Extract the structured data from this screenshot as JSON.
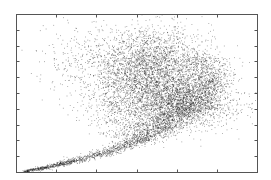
{
  "chart_data": {
    "type": "scatter",
    "title": "",
    "xlabel": "",
    "ylabel": "",
    "xlim": [
      0,
      6
    ],
    "ylim": [
      0,
      10
    ],
    "x_ticks": [
      1,
      2,
      3,
      4,
      5
    ],
    "y_ticks": [
      1,
      2,
      3,
      4,
      5,
      6,
      7,
      8,
      9
    ],
    "x_tick_labels": [],
    "y_tick_labels": [],
    "grid": false,
    "legend": null,
    "point_color": "#1a1a1a",
    "series": [
      {
        "name": "points",
        "components": [
          {
            "kind": "tail",
            "path": [
              [
                0.2,
                0.05
              ],
              [
                0.8,
                0.35
              ],
              [
                1.5,
                0.75
              ],
              [
                2.2,
                1.25
              ],
              [
                2.9,
                1.9
              ],
              [
                3.4,
                2.4
              ],
              [
                3.9,
                3.0
              ]
            ],
            "spread": 0.12,
            "count": 1400
          },
          {
            "kind": "blob",
            "center": [
              3.35,
              6.5
            ],
            "sd": [
              0.75,
              1.3
            ],
            "count": 3200
          },
          {
            "kind": "blob",
            "center": [
              4.05,
              4.4
            ],
            "sd": [
              0.55,
              0.8
            ],
            "count": 1800
          },
          {
            "kind": "arc",
            "path": [
              [
                2.7,
                2.2
              ],
              [
                3.5,
                3.2
              ],
              [
                4.2,
                4.0
              ],
              [
                4.7,
                5.0
              ],
              [
                4.9,
                6.0
              ],
              [
                4.6,
                7.2
              ]
            ],
            "spread": 0.28,
            "count": 1400
          },
          {
            "kind": "blob",
            "center": [
              2.7,
              4.2
            ],
            "sd": [
              0.45,
              0.9
            ],
            "count": 500
          },
          {
            "kind": "sparse",
            "center": [
              1.5,
              7.0
            ],
            "sd": [
              0.55,
              1.2
            ],
            "count": 180
          },
          {
            "kind": "sparse",
            "center": [
              5.3,
              4.2
            ],
            "sd": [
              0.35,
              0.6
            ],
            "count": 90
          }
        ],
        "representative_points": [
          [
            0.22,
            0.06
          ],
          [
            0.6,
            0.25
          ],
          [
            1.0,
            0.45
          ],
          [
            1.5,
            0.75
          ],
          [
            2.0,
            1.1
          ],
          [
            2.5,
            1.5
          ],
          [
            3.0,
            2.0
          ],
          [
            3.35,
            2.35
          ],
          [
            3.8,
            3.0
          ],
          [
            4.2,
            3.9
          ],
          [
            4.6,
            4.8
          ],
          [
            4.8,
            5.8
          ],
          [
            3.35,
            6.5
          ],
          [
            2.8,
            7.2
          ],
          [
            3.9,
            7.4
          ],
          [
            3.2,
            8.6
          ],
          [
            2.3,
            6.0
          ],
          [
            4.1,
            4.4
          ],
          [
            1.3,
            7.1
          ],
          [
            1.1,
            5.6
          ],
          [
            5.4,
            4.0
          ]
        ]
      }
    ]
  },
  "plot_area": {
    "left": 16,
    "top": 14,
    "right": 257,
    "bottom": 172
  }
}
